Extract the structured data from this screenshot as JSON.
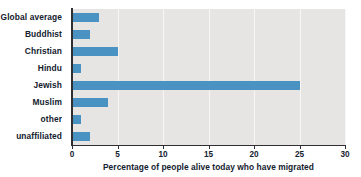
{
  "chart_data": {
    "type": "bar",
    "orientation": "horizontal",
    "title": "",
    "xlabel": "Percentage of people alive today who have migrated",
    "ylabel": "",
    "categories": [
      "Global average",
      "Buddhist",
      "Christian",
      "Hindu",
      "Jewish",
      "Muslim",
      "other",
      "unaffiliated"
    ],
    "values": [
      3,
      2,
      5,
      1,
      25,
      4,
      1,
      2
    ],
    "xlim": [
      0,
      30
    ],
    "xticks": [
      0,
      5,
      10,
      15,
      20,
      25,
      30
    ],
    "xtick_labels": [
      "0",
      "5",
      "10",
      "15",
      "20",
      "25",
      "30"
    ],
    "grid": true,
    "grid_axis": "x",
    "legend": null,
    "series": [
      {
        "name": "Percentage of people alive today who have migrated",
        "color": "#4a92c2",
        "values": [
          3,
          2,
          5,
          1,
          25,
          4,
          1,
          2
        ]
      }
    ]
  },
  "style": {
    "bar_color": "#4a92c2",
    "plot_background": "#e7e5e3",
    "gridline_color": "#f7f6f5",
    "axis_color": "#2f2f33",
    "text_color": "#13212e",
    "page_background": "#ffffff"
  }
}
